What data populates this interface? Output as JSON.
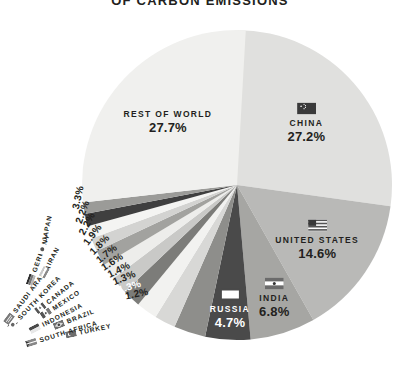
{
  "title": "OF CARBON EMISSIONS",
  "chart_data": {
    "type": "pie",
    "title": "OF CARBON EMISSIONS",
    "unit": "percent",
    "legend": "none",
    "grid": false,
    "total": 100.0,
    "categories": [
      "China",
      "United States",
      "India",
      "Russia",
      "Japan",
      "Germany",
      "Iran",
      "Saudi Arabia",
      "South Korea",
      "Canada",
      "Mexico",
      "Indonesia",
      "Brazil",
      "South Africa",
      "Turkey",
      "Rest of World"
    ],
    "values": [
      27.2,
      14.6,
      6.8,
      4.7,
      3.3,
      2.2,
      2.2,
      1.9,
      1.8,
      1.7,
      1.6,
      1.4,
      1.3,
      1.3,
      1.2,
      27.7
    ],
    "slices": [
      {
        "name": "CHINA",
        "value": 27.2,
        "label": "27.2%",
        "color": "#e0e0de",
        "flag": "china-flag",
        "placement": "inside"
      },
      {
        "name": "UNITED STATES",
        "value": 14.6,
        "label": "14.6%",
        "color": "#b9b9b7",
        "flag": "usa-flag",
        "placement": "inside"
      },
      {
        "name": "INDIA",
        "value": 6.8,
        "label": "6.8%",
        "color": "#a6a6a3",
        "flag": "india-flag",
        "placement": "inside"
      },
      {
        "name": "RUSSIA",
        "value": 4.7,
        "label": "4.7%",
        "color": "#4a4a4a",
        "flag": "russia-flag",
        "placement": "inside-dark"
      },
      {
        "name": "JAPAN",
        "value": 3.3,
        "label": "3.3%",
        "color": "#8e8e8b",
        "placement": "callout"
      },
      {
        "name": "GERMANY",
        "value": 2.2,
        "label": "2.2%",
        "color": "#d8d8d6",
        "placement": "callout"
      },
      {
        "name": "IRAN",
        "value": 2.2,
        "label": "2.2%",
        "color": "#f2f2f0",
        "placement": "callout"
      },
      {
        "name": "SAUDI ARABIA",
        "value": 1.9,
        "label": "1.9%",
        "color": "#7c7c79",
        "placement": "callout"
      },
      {
        "name": "SOUTH KOREA",
        "value": 1.8,
        "label": "1.8%",
        "color": "#c9c9c7",
        "placement": "callout"
      },
      {
        "name": "CANADA",
        "value": 1.7,
        "label": "1.7%",
        "color": "#ededeb",
        "placement": "callout"
      },
      {
        "name": "MEXICO",
        "value": 1.6,
        "label": "1.6%",
        "color": "#a2a29f",
        "placement": "callout"
      },
      {
        "name": "INDONESIA",
        "value": 1.4,
        "label": "1.4%",
        "color": "#d3d3d1",
        "placement": "callout"
      },
      {
        "name": "BRAZIL",
        "value": 1.3,
        "label": "1.3%",
        "color": "#f4f4f2",
        "placement": "callout"
      },
      {
        "name": "SOUTH AFRICA",
        "value": 1.3,
        "label": "1.3%",
        "color": "#3f3f3f",
        "placement": "callout-dark"
      },
      {
        "name": "TURKEY",
        "value": 1.2,
        "label": "1.2%",
        "color": "#9b9b98",
        "placement": "callout"
      },
      {
        "name": "REST OF WORLD",
        "value": 27.7,
        "label": "27.7%",
        "color": "#f0f0ee",
        "placement": "inside"
      }
    ]
  },
  "pie": {
    "china": {
      "name": "CHINA",
      "pct": "27.2%"
    },
    "united_states": {
      "name": "UNITED STATES",
      "pct": "14.6%"
    },
    "india": {
      "name": "INDIA",
      "pct": "6.8%"
    },
    "russia": {
      "name": "RUSSIA",
      "pct": "4.7%"
    },
    "rest_of_world": {
      "name": "REST OF WORLD",
      "pct": "27.7%"
    }
  },
  "callouts": [
    {
      "name": "TURKEY",
      "pct": "1.2%"
    },
    {
      "name": "SOUTH AFRICA",
      "pct": "1.3%"
    },
    {
      "name": "BRAZIL",
      "pct": "1.3%"
    },
    {
      "name": "INDONESIA",
      "pct": "1.4%"
    },
    {
      "name": "MEXICO",
      "pct": "1.6%"
    },
    {
      "name": "CANADA",
      "pct": "1.7%"
    },
    {
      "name": "SOUTH KOREA",
      "pct": "1.8%"
    },
    {
      "name": "SAUDI ARABIA",
      "pct": "1.9%"
    },
    {
      "name": "IRAN",
      "pct": "2.2%"
    },
    {
      "name": "GERMANY",
      "pct": "2.2%"
    },
    {
      "name": "JAPAN",
      "pct": "3.3%"
    }
  ],
  "colors": {
    "text": "#231f20",
    "background": "#ffffff",
    "dark_slice": "#4a4a4a"
  }
}
